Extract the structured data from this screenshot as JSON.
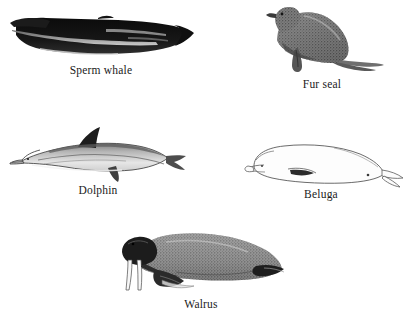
{
  "page": {
    "background_color": "#ffffff",
    "width": 406,
    "height": 324,
    "ink_color": "#1a1a1a"
  },
  "figures": [
    {
      "id": "sperm-whale",
      "label": "Sperm whale",
      "icon": "sperm-whale-illustration",
      "style": "solid black silhouette engraving",
      "facing": "left",
      "position": "top-left"
    },
    {
      "id": "fur-seal",
      "label": "Fur seal",
      "icon": "fur-seal-illustration",
      "style": "stippled grey engraving",
      "facing": "left",
      "position": "top-right"
    },
    {
      "id": "dolphin",
      "label": "Dolphin",
      "icon": "dolphin-illustration",
      "style": "line engraving with dark dorsal fin",
      "facing": "left",
      "position": "middle-left"
    },
    {
      "id": "beluga",
      "label": "Beluga",
      "icon": "beluga-illustration",
      "style": "light outline drawing",
      "facing": "left",
      "position": "middle-right"
    },
    {
      "id": "walrus",
      "label": "Walrus",
      "icon": "walrus-illustration",
      "style": "stippled engraving with white tusks",
      "facing": "left",
      "position": "bottom-center"
    }
  ]
}
